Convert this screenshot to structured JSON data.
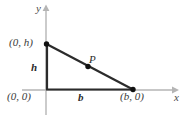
{
  "figure": {
    "type": "geometry-diagram",
    "background_color": "#ffffff",
    "axis_color": "#b3b3b3",
    "triangle_color": "#2b2b2b",
    "point_color": "#1a1a1a"
  },
  "axes": {
    "x_label": "x",
    "y_label": "y",
    "x_axis_start": [
      22,
      90
    ],
    "x_axis_end": [
      175,
      90
    ],
    "y_axis_start": [
      46,
      8
    ],
    "y_axis_end": [
      46,
      115
    ]
  },
  "labels": {
    "vertex_top": "(0, h)",
    "vertex_origin": "(0, 0)",
    "vertex_right": "(b, 0)",
    "leg_vertical": "h",
    "leg_horizontal": "b",
    "point_on_hypotenuse": "P"
  },
  "geometry": {
    "vertices": {
      "top": [
        46,
        44
      ],
      "origin": [
        46,
        90
      ],
      "right": [
        133,
        90
      ]
    },
    "point_P": [
      88,
      70
    ],
    "dot_radius": 2.6
  }
}
